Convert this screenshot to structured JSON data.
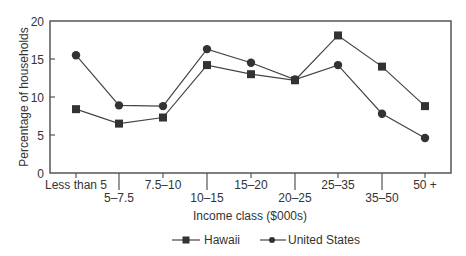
{
  "chart_data": {
    "type": "line",
    "title": "",
    "xlabel": "Income class ($000s)",
    "ylabel": "Percentage of households",
    "ylim": [
      0,
      20
    ],
    "yticks": [
      0,
      5,
      10,
      15,
      20
    ],
    "grid": false,
    "legend_position": "bottom",
    "categories": [
      "Less than 5",
      "5–7.5",
      "7.5–10",
      "10–15",
      "15–20",
      "20–25",
      "25–35",
      "35–50",
      "50 +"
    ],
    "series": [
      {
        "name": "Hawaii",
        "marker": "square",
        "values": [
          8.4,
          6.5,
          7.3,
          14.2,
          13.0,
          12.2,
          18.1,
          14.0,
          8.8
        ]
      },
      {
        "name": "United States",
        "marker": "circle",
        "values": [
          15.5,
          8.9,
          8.8,
          16.3,
          14.5,
          12.3,
          14.2,
          7.8,
          4.6
        ]
      }
    ]
  },
  "colors": {
    "line": "#444444",
    "marker": "#333333",
    "axis": "#555555"
  }
}
